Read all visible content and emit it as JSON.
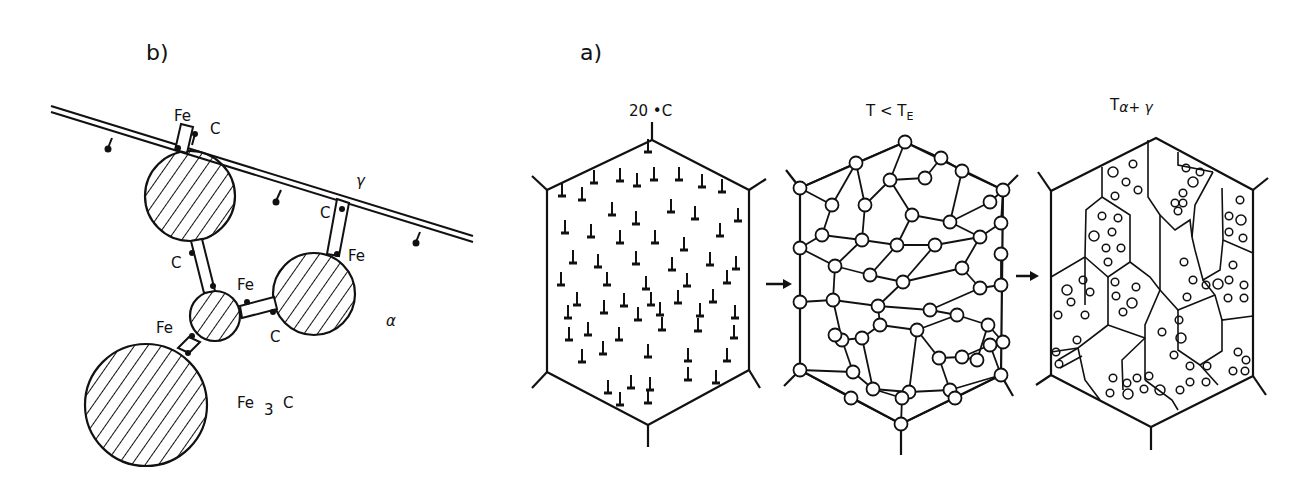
{
  "figure": {
    "panel_b": {
      "label": "b)",
      "labels": {
        "fe_top": "Fe",
        "c_top": "C",
        "gamma": "γ",
        "c_bridge_right": "C",
        "fe_bridge_right": "Fe",
        "c_bridge_left": "C",
        "fe_small_right": "Fe",
        "c_small_right": "C",
        "fe_small_left": "Fe",
        "alpha": "α",
        "fe3c_main": "Fe",
        "fe3c_sub": "3",
        "fe3c_c": "C"
      }
    },
    "panel_a": {
      "label": "a)",
      "stages": [
        {
          "title": "20 °C",
          "title_main": "20 •C"
        },
        {
          "title": "T < T_E",
          "title_main": "T < T",
          "title_sub": "E"
        },
        {
          "title": "T α+γ",
          "title_main": "T",
          "title_sub": "α+ γ"
        }
      ]
    },
    "colors": {
      "ink": "#111111",
      "background": "#ffffff"
    }
  }
}
